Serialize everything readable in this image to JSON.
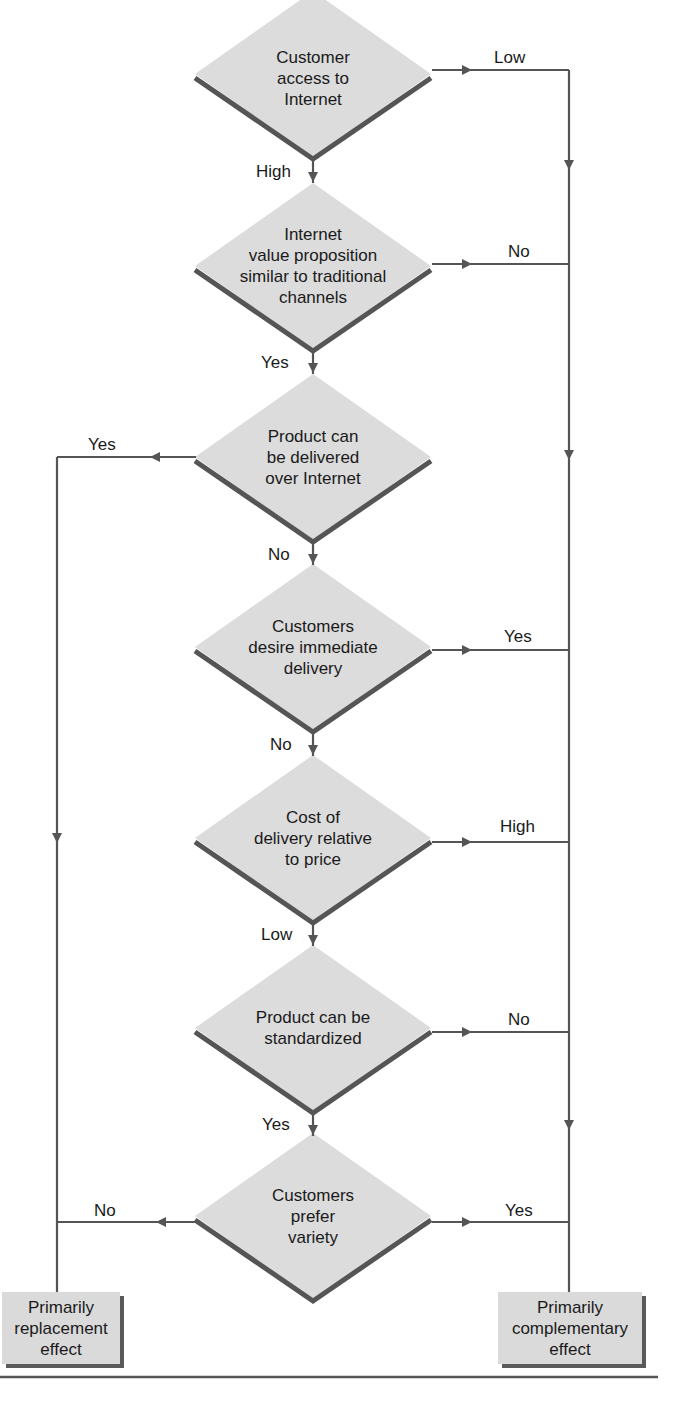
{
  "diagram": {
    "colors": {
      "diamond_fill": "#dcdcdc",
      "shadow": "#555555",
      "line": "#555555",
      "text": "#1a1a1a"
    },
    "decisions": [
      {
        "id": "d1",
        "text": "Customer\naccess to\nInternet",
        "down_label": "High",
        "side_label": "Low",
        "side": "right"
      },
      {
        "id": "d2",
        "text": "Internet\nvalue proposition\nsimilar to traditional\nchannels",
        "down_label": "Yes",
        "side_label": "No",
        "side": "right"
      },
      {
        "id": "d3",
        "text": "Product can\nbe delivered\nover Internet",
        "down_label": "No",
        "side_label": "Yes",
        "side": "left"
      },
      {
        "id": "d4",
        "text": "Customers\ndesire immediate\ndelivery",
        "down_label": "No",
        "side_label": "Yes",
        "side": "right"
      },
      {
        "id": "d5",
        "text": "Cost of\ndelivery relative\nto price",
        "down_label": "Low",
        "side_label": "High",
        "side": "right"
      },
      {
        "id": "d6",
        "text": "Product can be\nstandardized",
        "down_label": "Yes",
        "side_label": "No",
        "side": "right"
      },
      {
        "id": "d7",
        "text": "Customers\nprefer\nvariety",
        "down_label": "",
        "left_label": "No",
        "right_label": "Yes",
        "side": "both"
      }
    ],
    "outcomes": {
      "left": "Primarily\nreplacement\neffect",
      "right": "Primarily\ncomplementary\neffect"
    }
  }
}
